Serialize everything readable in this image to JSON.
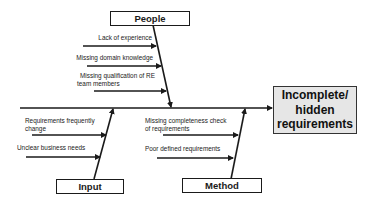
{
  "diagram": {
    "type": "fishbone",
    "effect": {
      "label": "Incomplete/ hidden requirements",
      "lines": [
        "Incomplete/",
        "hidden",
        "requirements"
      ]
    },
    "categories": [
      {
        "name": "People",
        "position": "top-left",
        "causes": [
          {
            "lines": [
              "Lack of experience"
            ]
          },
          {
            "lines": [
              "Missing domain knowledge"
            ]
          },
          {
            "lines": [
              "Missing qualification of RE",
              "team members"
            ]
          }
        ]
      },
      {
        "name": "Input",
        "position": "bottom-left",
        "causes": [
          {
            "lines": [
              "Requirements frequently",
              "change"
            ]
          },
          {
            "lines": [
              "Unclear business needs"
            ]
          }
        ]
      },
      {
        "name": "Method",
        "position": "bottom-right",
        "causes": [
          {
            "lines": [
              "Missing completeness check",
              "of requirements"
            ]
          },
          {
            "lines": [
              "Poor defined requirements"
            ]
          }
        ]
      }
    ],
    "colors": {
      "line": "#1a1a1a",
      "effect_fill": "#e6e6e6",
      "background": "#ffffff"
    }
  }
}
